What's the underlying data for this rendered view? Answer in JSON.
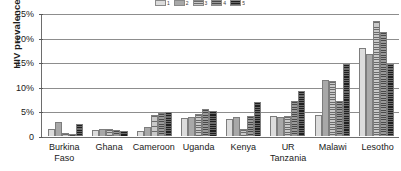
{
  "chart_data": {
    "type": "bar",
    "title": "",
    "subtitle": "",
    "xlabel": "",
    "ylabel": "HIV prevalence",
    "ylim": [
      0,
      25
    ],
    "yunit": "%",
    "grid": true,
    "legend_position": "top",
    "orientation": "vertical",
    "grouping": "clustered",
    "categories": [
      "Burkina Faso",
      "Ghana",
      "Cameroon",
      "Uganda",
      "Kenya",
      "UR Tanzania",
      "Malawi",
      "Lesotho"
    ],
    "category_lines": [
      [
        "Burkina",
        "Faso"
      ],
      [
        "Ghana",
        ""
      ],
      [
        "Cameroon",
        ""
      ],
      [
        "Uganda",
        ""
      ],
      [
        "Kenya",
        ""
      ],
      [
        "UR",
        "Tanzania"
      ],
      [
        "Malawi",
        ""
      ],
      [
        "Lesotho",
        ""
      ]
    ],
    "ytick_labels": [
      "25%",
      "20%",
      "15%",
      "10%",
      "5%",
      "0"
    ],
    "ytick_values": [
      25,
      20,
      15,
      10,
      5,
      0
    ],
    "series": [
      {
        "name": "1",
        "fill": "light-gray-solid",
        "color": "#dcdcdc",
        "values": [
          1.4,
          1.2,
          1.1,
          3.7,
          3.4,
          4.0,
          4.3,
          17.9
        ]
      },
      {
        "name": "2",
        "fill": "medium-gray-solid",
        "color": "#a8a8a8",
        "values": [
          2.8,
          1.4,
          1.9,
          3.9,
          3.9,
          3.9,
          11.4,
          16.6
        ]
      },
      {
        "name": "3",
        "fill": "light-gray-hatched",
        "color": "#c9c9c9",
        "values": [
          0.6,
          1.5,
          4.3,
          4.4,
          1.5,
          4.1,
          11.1,
          23.4
        ]
      },
      {
        "name": "4",
        "fill": "medium-gray-hatched",
        "color": "#9a9a9a",
        "values": [
          0.3,
          1.2,
          4.6,
          5.4,
          4.1,
          7.2,
          7.2,
          21.2
        ]
      },
      {
        "name": "5",
        "fill": "dark-gray-hatched",
        "color": "#6a6a6a",
        "values": [
          2.4,
          0.9,
          4.9,
          5.1,
          6.9,
          9.2,
          14.7,
          14.6
        ]
      }
    ]
  },
  "legend": {
    "entries": [
      {
        "label": "1",
        "series": "1"
      },
      {
        "label": "2",
        "series": "2"
      },
      {
        "label": "3",
        "series": "3"
      },
      {
        "label": "4",
        "series": "4"
      },
      {
        "label": "5",
        "series": "5"
      }
    ]
  }
}
